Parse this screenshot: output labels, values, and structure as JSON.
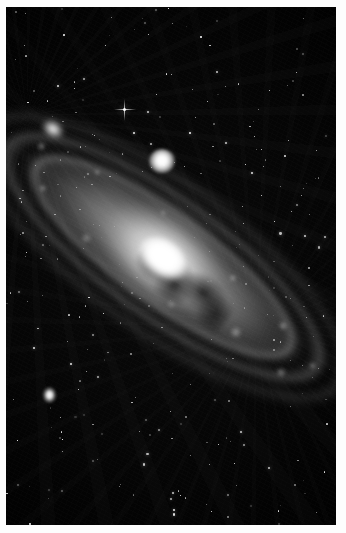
{
  "image": {
    "kind": "astronomical-photograph",
    "subject": "Andromeda Galaxy (M31)",
    "medium": "black-and-white photographic plate print",
    "orientation": "portrait",
    "width_px": 346,
    "height_px": 533,
    "border": {
      "color": "#ffffff",
      "left_px": 6,
      "top_px": 7,
      "right_px": 10,
      "bottom_px": 8
    },
    "palette": {
      "sky_black": "#000000",
      "deep_background": "#050505",
      "disc_gray": "#969696",
      "arm_light": "#d7d7d7",
      "core_white": "#ffffff",
      "dust_lane": "#0a0a0a"
    }
  },
  "scene": {
    "background_label": "night-sky-star-field",
    "galaxy": {
      "name": "spiral-galaxy-m31",
      "center_x_pct": 47,
      "center_y_pct": 49,
      "major_axis_angle_deg": 36,
      "major_axis_px": 470,
      "minor_axis_px": 168,
      "nucleus": {
        "label": "overexposed-nucleus",
        "width_px": 62,
        "height_px": 43,
        "brightness": "saturated-white"
      },
      "features": [
        "outer-halo",
        "luminous-disc",
        "central-bulge",
        "spiral-arm-inner",
        "spiral-arm-middle",
        "spiral-arm-outer",
        "dust-lane-inner",
        "dust-lane-outer",
        "core-dust-mottling",
        "hii-region-knots"
      ]
    },
    "satellites": [
      {
        "id": "m32",
        "label": "companion-galaxy-m32",
        "x_px": 143,
        "y_px": 142,
        "width_px": 26,
        "height_px": 24,
        "shape": "compact-round"
      },
      {
        "id": "m110",
        "label": "companion-galaxy-m110",
        "x_px": 32,
        "y_px": 111,
        "width_px": 30,
        "height_px": 22,
        "shape": "elongated-diffuse"
      },
      {
        "id": "field-blob",
        "label": "field-object-lower-left",
        "x_px": 36,
        "y_px": 379,
        "width_px": 15,
        "height_px": 18,
        "shape": "small-oval"
      }
    ],
    "bright_star": {
      "label": "bright-star-with-diffraction-spikes",
      "x_px": 123,
      "y_px": 108,
      "size_px": 3
    },
    "star_field": {
      "count": 340,
      "seed": 20240117,
      "size_min_px": 0.6,
      "size_max_px": 2.4,
      "opacity_min": 0.18,
      "opacity_max": 1.0
    }
  }
}
